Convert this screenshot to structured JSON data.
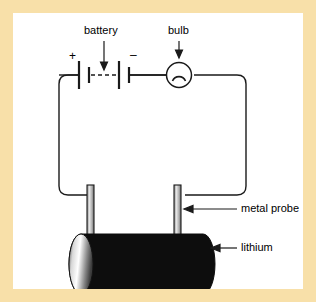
{
  "figure": {
    "background_color": "#ffffff",
    "border_color": "#f8e0a9",
    "stroke_color": "#1a1a1a"
  },
  "labels": {
    "battery": "battery",
    "bulb": "bulb",
    "metal_probe": "metal probe",
    "lithium": "lithium",
    "plus_sign": "+",
    "minus_sign": "–"
  },
  "components": {
    "battery": {
      "name": "battery",
      "symbol": "multi-cell battery",
      "plates": 4,
      "has_dashed_continuation": true,
      "terminal_plus": "+",
      "terminal_minus": "–",
      "pointer": "down-arrow"
    },
    "bulb": {
      "name": "bulb",
      "symbol": "lamp circle with filament arch",
      "pointer": "down-arrow"
    },
    "metal_probe": {
      "name": "metal probe",
      "count": 2,
      "color": "#b7b7b7",
      "outline": "#1a1a1a",
      "pointer": "left-arrow"
    },
    "lithium": {
      "name": "lithium",
      "shape": "cylinder",
      "body_color": "#0d0d0d",
      "end_cap_gradient": [
        "#ffffff",
        "#7a7a7a"
      ],
      "pointer": "left-arrow"
    },
    "wire": {
      "name": "circuit wire",
      "shape": "rounded rectangle loop",
      "color": "#1a1a1a"
    }
  }
}
